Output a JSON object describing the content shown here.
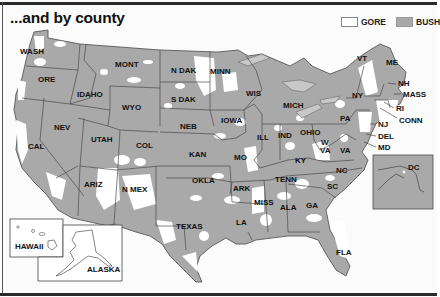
{
  "title": "...and by county",
  "legend": {
    "gore_label": "GORE",
    "bush_label": "BUSH",
    "gore_color": "#ffffff",
    "bush_color": "#a9a9a9"
  },
  "colors": {
    "state_fill": "#a9a9a9",
    "border": "#555555",
    "background": "#fbfbfb",
    "lakes": "#c8c8c8"
  },
  "states": [
    {
      "label": "WASH",
      "x": 20,
      "y": 54
    },
    {
      "label": "ORE",
      "x": 38,
      "y": 82
    },
    {
      "label": "IDAHO",
      "x": 77,
      "y": 97
    },
    {
      "label": "MONT",
      "x": 115,
      "y": 67
    },
    {
      "label": "WYO",
      "x": 122,
      "y": 110
    },
    {
      "label": "N DAK",
      "x": 171,
      "y": 73
    },
    {
      "label": "S DAK",
      "x": 171,
      "y": 102
    },
    {
      "label": "MINN",
      "x": 210,
      "y": 74
    },
    {
      "label": "NEB",
      "x": 180,
      "y": 129
    },
    {
      "label": "IOWA",
      "x": 221,
      "y": 123
    },
    {
      "label": "WIS",
      "x": 246,
      "y": 96
    },
    {
      "label": "MICH",
      "x": 283,
      "y": 108
    },
    {
      "label": "NEV",
      "x": 54,
      "y": 130
    },
    {
      "label": "UTAH",
      "x": 91,
      "y": 142
    },
    {
      "label": "COL",
      "x": 136,
      "y": 148
    },
    {
      "label": "CAL",
      "x": 28,
      "y": 149
    },
    {
      "label": "KAN",
      "x": 189,
      "y": 157
    },
    {
      "label": "MO",
      "x": 234,
      "y": 160
    },
    {
      "label": "ILL",
      "x": 257,
      "y": 140
    },
    {
      "label": "IND",
      "x": 278,
      "y": 138
    },
    {
      "label": "OHIO",
      "x": 300,
      "y": 135
    },
    {
      "label": "W",
      "x": 321,
      "y": 145
    },
    {
      "label": "VA",
      "x": 320,
      "y": 153
    },
    {
      "label": "VA",
      "x": 340,
      "y": 153
    },
    {
      "label": "KY",
      "x": 295,
      "y": 163
    },
    {
      "label": "PA",
      "x": 340,
      "y": 121
    },
    {
      "label": "NY",
      "x": 352,
      "y": 98
    },
    {
      "label": "VT",
      "x": 357,
      "y": 61
    },
    {
      "label": "ME",
      "x": 386,
      "y": 65
    },
    {
      "label": "NH",
      "x": 398,
      "y": 86
    },
    {
      "label": "MASS",
      "x": 403,
      "y": 97
    },
    {
      "label": "RI",
      "x": 396,
      "y": 111
    },
    {
      "label": "CONN",
      "x": 399,
      "y": 123
    },
    {
      "label": "NJ",
      "x": 378,
      "y": 127
    },
    {
      "label": "DEL",
      "x": 378,
      "y": 139
    },
    {
      "label": "MD",
      "x": 378,
      "y": 150
    },
    {
      "label": "DC",
      "x": 408,
      "y": 170
    },
    {
      "label": "NC",
      "x": 336,
      "y": 173
    },
    {
      "label": "SC",
      "x": 327,
      "y": 189
    },
    {
      "label": "TENN",
      "x": 275,
      "y": 182
    },
    {
      "label": "ARK",
      "x": 233,
      "y": 191
    },
    {
      "label": "MISS",
      "x": 254,
      "y": 205
    },
    {
      "label": "ALA",
      "x": 280,
      "y": 210
    },
    {
      "label": "GA",
      "x": 306,
      "y": 208
    },
    {
      "label": "LA",
      "x": 236,
      "y": 225
    },
    {
      "label": "FLA",
      "x": 336,
      "y": 255
    },
    {
      "label": "OKLA",
      "x": 192,
      "y": 183
    },
    {
      "label": "TEXAS",
      "x": 176,
      "y": 229
    },
    {
      "label": "ARIZ",
      "x": 84,
      "y": 187
    },
    {
      "label": "N MEX",
      "x": 122,
      "y": 192
    },
    {
      "label": "HAWAII",
      "x": 15,
      "y": 249
    },
    {
      "label": "ALASKA",
      "x": 87,
      "y": 272
    }
  ]
}
